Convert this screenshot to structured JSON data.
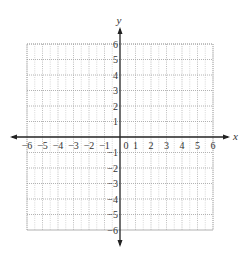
{
  "diagram": {
    "type": "coordinate-plane",
    "x_axis": {
      "label": "x",
      "min": -6,
      "max": 6,
      "step": 1
    },
    "y_axis": {
      "label": "y",
      "min": -6,
      "max": 6,
      "step": 1
    },
    "x_tick_labels": [
      "-6",
      "-5",
      "-4",
      "-3",
      "-2",
      "-1",
      "0",
      "1",
      "2",
      "3",
      "4",
      "5",
      "6"
    ],
    "y_tick_labels": [
      "6",
      "5",
      "4",
      "3",
      "2",
      "1",
      "-1",
      "-2",
      "-3",
      "-4",
      "-5",
      "-6"
    ],
    "origin_label": "0",
    "grid": {
      "style": "dotted",
      "minor_style": "dotted",
      "color": "#9a9a9a"
    },
    "colors": {
      "axis": "#222222",
      "grid": "#a0a0a0",
      "text": "#333333",
      "background": "#ffffff"
    }
  },
  "render": {
    "origin_px": [
      120,
      137
    ],
    "unit_px": 15.5
  }
}
